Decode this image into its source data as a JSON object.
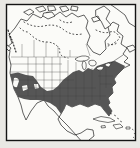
{
  "map": {
    "description": "Range map of North America with shaded species distribution covering the southern and eastern United States",
    "colors": {
      "page_bg": "#e9e8e4",
      "map_bg": "#fbfbf8",
      "coast": "#1e1e1e",
      "range_fill": "#565656",
      "border_line": "#3f3f3f",
      "lake_dot": "#262626",
      "frame": "#141414"
    }
  }
}
